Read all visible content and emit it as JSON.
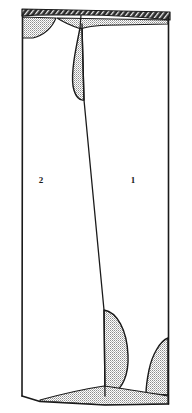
{
  "figure": {
    "kind": "section-drawing",
    "title": "",
    "width": 192,
    "height": 413,
    "background_color": "#ffffff",
    "line_color": "#1a1a1a",
    "stipple_color": "#8d8d8d",
    "hatch_color": "#232323",
    "fill_color": "#ffffff"
  },
  "labels": {
    "unit_right": {
      "text": "1",
      "x": 133,
      "y": 181
    },
    "unit_left": {
      "text": "2",
      "x": 41,
      "y": 181
    }
  },
  "regions": [
    {
      "name": "top-hatched-band",
      "pattern": "diagonal-hatch",
      "description": "dark hatched strip spanning the top edge"
    },
    {
      "name": "upper-left-stipple-lobe",
      "pattern": "stipple",
      "description": "stippled lobe beneath top band at left"
    },
    {
      "name": "upper-center-stipple-lens",
      "pattern": "stipple",
      "description": "leaf shaped stippled lens hanging from top band at centre"
    },
    {
      "name": "upper-right-stipple-wedge",
      "pattern": "stipple",
      "description": "thin stippled wedge under top band at right"
    },
    {
      "name": "lower-center-stipple-lobe",
      "pattern": "stipple",
      "description": "stippled lobe rising from base at centre"
    },
    {
      "name": "lower-right-stipple-lobe",
      "pattern": "stipple",
      "description": "stippled lobe in lower right corner"
    },
    {
      "name": "basal-stipple-wedge",
      "pattern": "stipple",
      "description": "thin stippled wedge along the base"
    },
    {
      "name": "unit-1-body",
      "pattern": "blank",
      "description": "blank unit right of the diagonal boundary"
    },
    {
      "name": "unit-2-body",
      "pattern": "blank",
      "description": "blank unit left of the diagonal boundary"
    }
  ]
}
